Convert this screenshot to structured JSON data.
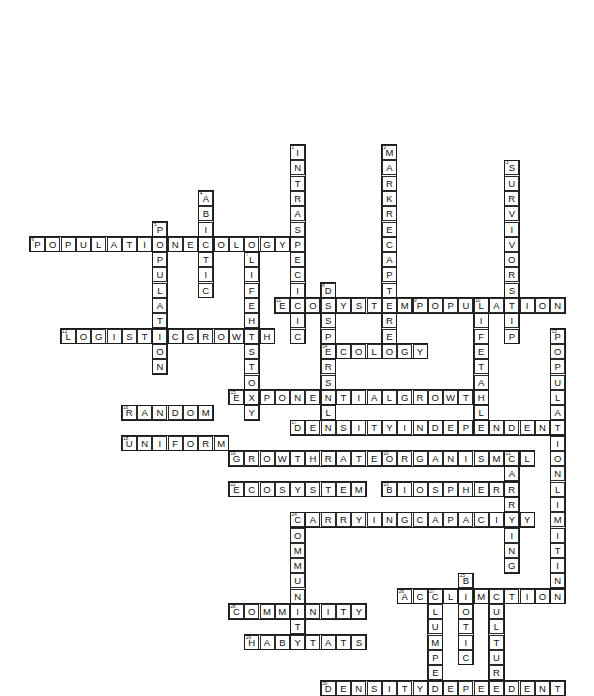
{
  "puzzle": {
    "title": "Ecology Crossword Puzzle",
    "cell_size": 15.3,
    "origin": {
      "x": 30,
      "y": 145
    },
    "grid_columns": 36,
    "grid_rows": 37,
    "colors": {
      "cell_border": "#2b2b2b",
      "word_border": "#1b1b1b",
      "cell_fill": "#ffffff",
      "text": "#111111",
      "page_background": "#ffffff"
    },
    "entries": [
      {
        "number": 1,
        "answer": "INTRASPECIFIC",
        "direction": "down",
        "row": 0,
        "col": 17
      },
      {
        "number": 2,
        "answer": "MARKRECAPTURE",
        "direction": "down",
        "row": 0,
        "col": 23
      },
      {
        "number": 3,
        "answer": "SURVIVORSHIP",
        "direction": "down",
        "row": 1,
        "col": 31
      },
      {
        "number": 4,
        "answer": "ABIOTIC",
        "direction": "down",
        "row": 3,
        "col": 11
      },
      {
        "number": 5,
        "answer": "POPULATION",
        "direction": "down",
        "row": 5,
        "col": 8
      },
      {
        "number": 6,
        "answer": "POPULATIONECOLOGY",
        "direction": "across",
        "row": 6,
        "col": 0
      },
      {
        "number": 7,
        "answer": "LIFEHISTORY",
        "direction": "down",
        "row": 7,
        "col": 14
      },
      {
        "number": 8,
        "answer": "DISPERSAL",
        "direction": "down",
        "row": 9,
        "col": 19
      },
      {
        "number": 9,
        "answer": "POPULATION",
        "direction": "across",
        "row": 10,
        "col": 25
      },
      {
        "number": 10,
        "answer": "LIFETABLE",
        "direction": "down",
        "row": 10,
        "col": 29
      },
      {
        "number": 11,
        "answer": "ECOSYSTEM",
        "direction": "across",
        "row": 10,
        "col": 16
      },
      {
        "number": 12,
        "answer": "LOGISTICGROWTH",
        "direction": "across",
        "row": 12,
        "col": 2
      },
      {
        "number": 13,
        "answer": "POPULATIONLIMITING",
        "direction": "down",
        "row": 12,
        "col": 34
      },
      {
        "number": 14,
        "answer": "ECOLOGY",
        "direction": "across",
        "row": 13,
        "col": 19
      },
      {
        "number": 15,
        "answer": "EXPONENTIALGROWTH",
        "direction": "across",
        "row": 16,
        "col": 13
      },
      {
        "number": 16,
        "answer": "RANDOM",
        "direction": "across",
        "row": 17,
        "col": 6
      },
      {
        "number": 17,
        "answer": "DENSITYINDEPENDENT",
        "direction": "across",
        "row": 18,
        "col": 17
      },
      {
        "number": 18,
        "answer": "UNIFORM",
        "direction": "across",
        "row": 19,
        "col": 6
      },
      {
        "number": 19,
        "answer": "GROWTHRATE",
        "direction": "across",
        "row": 20,
        "col": 13
      },
      {
        "number": 20,
        "answer": "ORGANISMAL",
        "direction": "across",
        "row": 20,
        "col": 23
      },
      {
        "number": 21,
        "answer": "AGEST",
        "direction": "down",
        "row": 20,
        "col": 31
      },
      {
        "number": 22,
        "answer": "ECOSYSTEM",
        "direction": "across",
        "row": 22,
        "col": 13
      },
      {
        "number": 23,
        "answer": "BIOSPHERE",
        "direction": "across",
        "row": 22,
        "col": 23
      },
      {
        "number": 24,
        "answer": "CARRYINGCAPACITY",
        "direction": "across",
        "row": 24,
        "col": 17
      },
      {
        "number": 25,
        "answer": "BIOTIC",
        "direction": "down",
        "row": 28,
        "col": 28
      },
      {
        "number": 26,
        "answer": "ACCLIMATION",
        "direction": "across",
        "row": 29,
        "col": 24
      },
      {
        "number": 27,
        "answer": "CLUMPED",
        "direction": "down",
        "row": 29,
        "col": 26
      },
      {
        "number": 28,
        "answer": "COMMUNITY",
        "direction": "across",
        "row": 30,
        "col": 13
      },
      {
        "number": 29,
        "answer": "HABITATS",
        "direction": "across",
        "row": 32,
        "col": 14
      },
      {
        "number": 30,
        "answer": "DENSITYDEPENDENT",
        "direction": "across",
        "row": 35,
        "col": 19
      }
    ],
    "additional_down_words": [
      {
        "answer": "COMMUNITY",
        "direction": "down",
        "row": 24,
        "col": 17,
        "number": 24
      },
      {
        "answer": "CULTURE",
        "direction": "down",
        "row": 29,
        "col": 30,
        "number": null
      },
      {
        "answer": "CARRYING",
        "direction": "down",
        "row": 20,
        "col": 31,
        "number": 21
      }
    ]
  }
}
